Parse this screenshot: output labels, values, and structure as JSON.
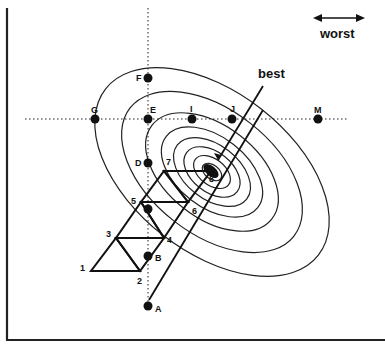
{
  "legend": {
    "worst_label": "worst",
    "best_label": "best"
  },
  "grid_points": [
    {
      "id": "A",
      "label": "A"
    },
    {
      "id": "B",
      "label": "B"
    },
    {
      "id": "C",
      "label": "C"
    },
    {
      "id": "D",
      "label": "D"
    },
    {
      "id": "E",
      "label": "E"
    },
    {
      "id": "F",
      "label": "F"
    },
    {
      "id": "G",
      "label": "G"
    },
    {
      "id": "I",
      "label": "I"
    },
    {
      "id": "J",
      "label": "J"
    },
    {
      "id": "M",
      "label": "M"
    }
  ],
  "simplex_vertices": [
    {
      "label": "1"
    },
    {
      "label": "2"
    },
    {
      "label": "3"
    },
    {
      "label": "4"
    },
    {
      "label": "5"
    },
    {
      "label": "6"
    },
    {
      "label": "7"
    },
    {
      "label": "8"
    }
  ],
  "colors": {
    "ink": "#111111",
    "background": "#ffffff"
  }
}
